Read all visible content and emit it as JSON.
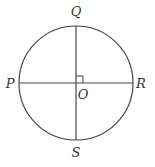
{
  "diagram": {
    "type": "geometry",
    "stroke_color": "#444444",
    "background": "#ffffff",
    "circle": {
      "center": "O",
      "cx": 76,
      "cy": 83,
      "r": 57
    },
    "points": {
      "Q": {
        "label": "Q",
        "x": 76,
        "y": 26,
        "label_x": 76,
        "label_y": 16
      },
      "S": {
        "label": "S",
        "x": 76,
        "y": 140,
        "label_x": 76,
        "label_y": 157
      },
      "P": {
        "label": "P",
        "x": 19,
        "y": 83,
        "label_x": 10,
        "label_y": 88
      },
      "R": {
        "label": "R",
        "x": 133,
        "y": 83,
        "label_x": 141,
        "label_y": 88
      },
      "O": {
        "label": "O",
        "x": 76,
        "y": 83,
        "label_x": 83,
        "label_y": 99
      }
    },
    "segments": [
      {
        "name": "diameter-QS",
        "from": "Q",
        "to": "S"
      },
      {
        "name": "diameter-PR",
        "from": "P",
        "to": "R"
      }
    ],
    "right_angle_marker": {
      "at": "O",
      "size": 7,
      "quadrant": "upper-right"
    }
  }
}
